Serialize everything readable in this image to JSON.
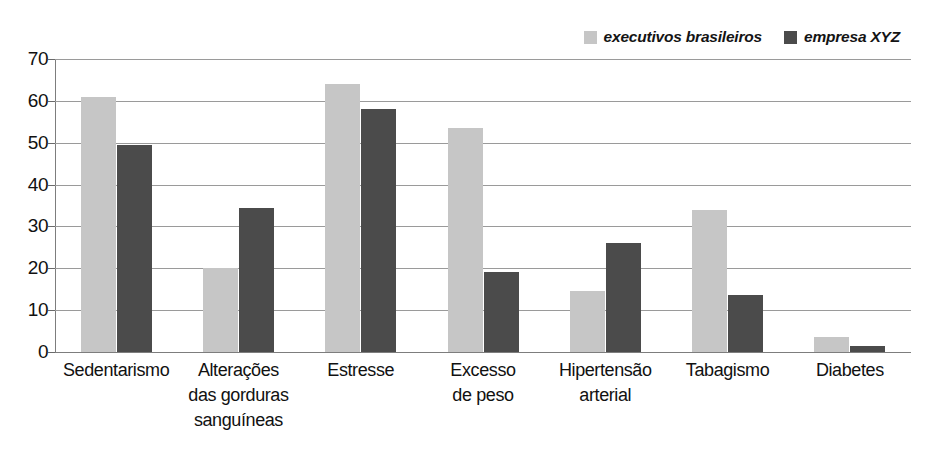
{
  "chart_data": {
    "type": "bar",
    "title": "",
    "subtitle": "",
    "xlabel": "",
    "ylabel": "",
    "ylim": [
      0,
      70
    ],
    "yticks": [
      0,
      10,
      20,
      30,
      40,
      50,
      60,
      70
    ],
    "grid": true,
    "legend_position": "top-right",
    "categories": [
      "Sedentarismo",
      "Alterações\ndas gorduras\nsanguíneas",
      "Estresse",
      "Excesso\nde peso",
      "Hipertensão\narterial",
      "Tabagismo",
      "Diabetes"
    ],
    "series": [
      {
        "name": "executivos brasileiros",
        "color": "#c6c6c6",
        "values": [
          61,
          20,
          64,
          53.5,
          14.5,
          34,
          3.5
        ]
      },
      {
        "name": "empresa XYZ",
        "color": "#4b4b4b",
        "values": [
          49.5,
          34.5,
          58,
          19,
          26,
          13.5,
          1.5
        ]
      }
    ]
  },
  "legend": {
    "entries": [
      {
        "label": "executivos brasileiros",
        "color": "#c6c6c6"
      },
      {
        "label": "empresa XYZ",
        "color": "#4b4b4b"
      }
    ]
  },
  "axis": {
    "y_tick_labels": [
      "70",
      "60",
      "50",
      "40",
      "30",
      "20",
      "10",
      "0"
    ]
  }
}
